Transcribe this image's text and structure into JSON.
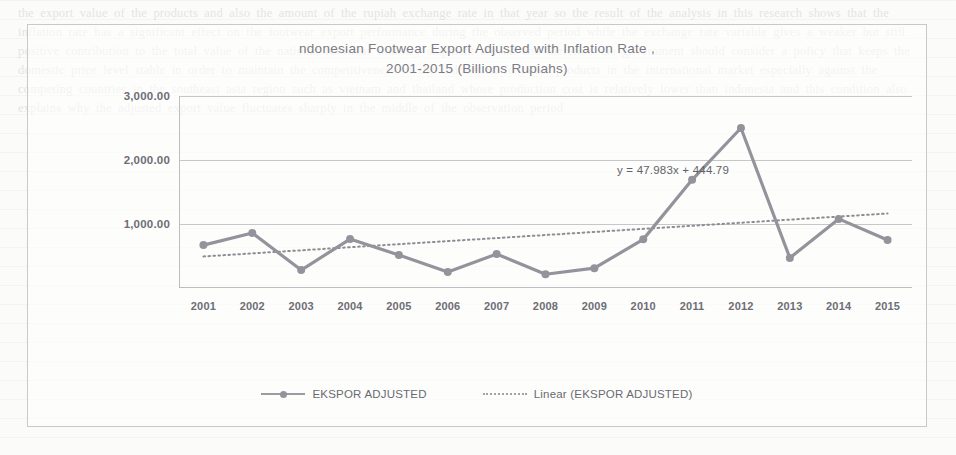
{
  "document": {
    "background_note": "scanned page with faint bleed-through text",
    "ghost_text": "the export value of the products and also the amount of the rupiah exchange rate in that year so the result of the analysis in this research shows that the inflation rate has a significant effect on the footwear export performance during the observed period while the exchange rate variable gives a weaker but still positive contribution to the total value of the national footwear industry shipment abroad and therefore the government should consider a policy that keeps the domestic price level stable in order to maintain the competitiveness of the indonesian footwear products in the international market especially against the competing countries in the southeast asia region such as vietnam and thailand whose production cost is relatively lower than indonesia and this condition also explains why the adjusted export value fluctuates sharply in the middle of the observation period"
  },
  "chart": {
    "title_line1": "ndonesian Footwear Export Adjusted with Inflation Rate ,",
    "title_line2": "2001-2015 (Billions Rupiahs)",
    "equation_annotation": "y = 47.983x + 444.79",
    "legend": [
      {
        "label": "EKSPOR ADJUSTED",
        "key": "solid-line-marker",
        "color": "#93939b"
      },
      {
        "label": "Linear (EKSPOR ADJUSTED)",
        "key": "dotted-line",
        "color": "#a2a2aa"
      }
    ],
    "colors": {
      "series_line": "#93939b",
      "trendline": "#8d8d95",
      "gridline": "#c6c6cb",
      "axis": "#bcbcc2",
      "text": "#6d6d75",
      "title": "#7b7b83",
      "border": "#c9c9cd"
    }
  },
  "chart_data": {
    "type": "line",
    "title": "ndonesian Footwear Export Adjusted with Inflation Rate , 2001-2015 (Billions Rupiahs)",
    "xlabel": "",
    "ylabel": "",
    "categories": [
      "2001",
      "2002",
      "2003",
      "2004",
      "2005",
      "2006",
      "2007",
      "2008",
      "2009",
      "2010",
      "2011",
      "2012",
      "2013",
      "2014",
      "2015"
    ],
    "ylim": [
      0,
      3000
    ],
    "yticks": [
      1000,
      2000,
      3000
    ],
    "ytick_labels": [
      "1,000.00",
      "2,000.00",
      "3,000.00"
    ],
    "grid": true,
    "legend_position": "bottom",
    "series": [
      {
        "name": "EKSPOR ADJUSTED",
        "style": "solid-with-markers",
        "values": [
          670,
          860,
          280,
          765,
          515,
          250,
          530,
          215,
          310,
          760,
          1690,
          2500,
          470,
          1080,
          750
        ]
      },
      {
        "name": "Linear (EKSPOR ADJUSTED)",
        "style": "dotted-trendline",
        "equation": "y = 47.983x + 444.79",
        "slope": 47.983,
        "intercept": 444.79,
        "values": [
          493,
          541,
          589,
          637,
          685,
          733,
          780,
          828,
          876,
          924,
          972,
          1020,
          1068,
          1116,
          1164
        ]
      }
    ]
  }
}
